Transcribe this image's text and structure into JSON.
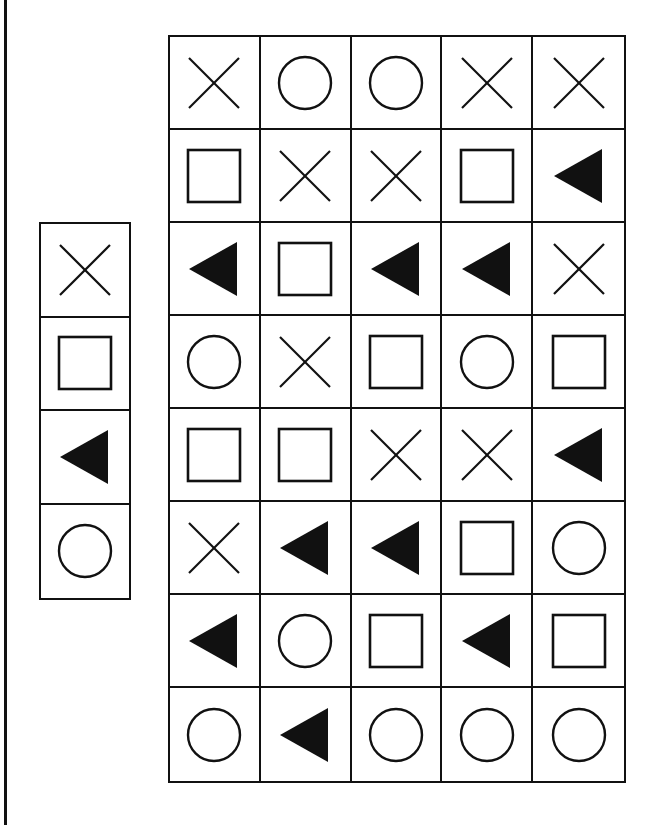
{
  "colors": {
    "ink": "#111111",
    "background": "#ffffff"
  },
  "symbols": {
    "x": "x-mark-icon",
    "square": "square-icon",
    "triangle": "filled-left-triangle-icon",
    "circle": "circle-icon"
  },
  "legend": {
    "items": [
      "x",
      "square",
      "triangle",
      "circle"
    ]
  },
  "grid": {
    "columns": 5,
    "rows": [
      [
        "x",
        "circle",
        "circle",
        "x",
        "x"
      ],
      [
        "square",
        "x",
        "x",
        "square",
        "triangle"
      ],
      [
        "triangle",
        "square",
        "triangle",
        "triangle",
        "x"
      ],
      [
        "circle",
        "x",
        "square",
        "circle",
        "square"
      ],
      [
        "square",
        "square",
        "x",
        "x",
        "triangle"
      ],
      [
        "x",
        "triangle",
        "triangle",
        "square",
        "circle"
      ],
      [
        "triangle",
        "circle",
        "square",
        "triangle",
        "square"
      ],
      [
        "circle",
        "triangle",
        "circle",
        "circle",
        "circle"
      ]
    ]
  }
}
